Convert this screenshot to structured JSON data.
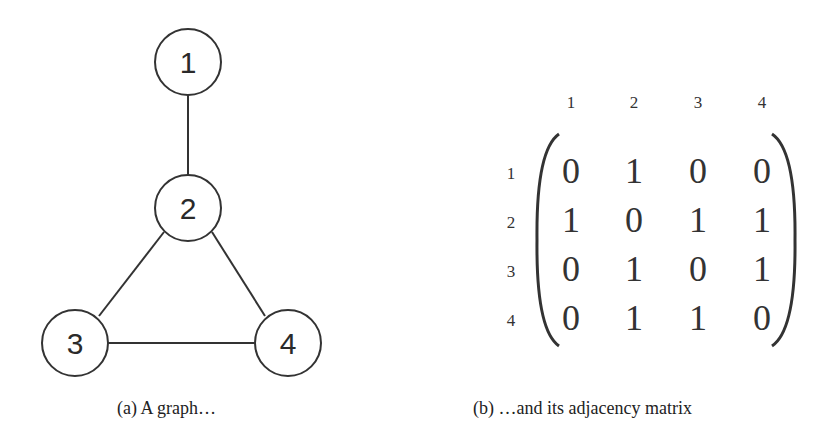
{
  "graph": {
    "nodes": [
      {
        "id": "1",
        "x": 188,
        "y": 62
      },
      {
        "id": "2",
        "x": 188,
        "y": 208
      },
      {
        "id": "3",
        "x": 75,
        "y": 343
      },
      {
        "id": "4",
        "x": 288,
        "y": 343
      }
    ],
    "edges": [
      [
        "1",
        "2"
      ],
      [
        "2",
        "3"
      ],
      [
        "2",
        "4"
      ],
      [
        "3",
        "4"
      ]
    ],
    "caption": "(a)  A graph…"
  },
  "matrix": {
    "col_labels": [
      "1",
      "2",
      "3",
      "4"
    ],
    "row_labels": [
      "1",
      "2",
      "3",
      "4"
    ],
    "rows": [
      [
        "0",
        "1",
        "0",
        "0"
      ],
      [
        "1",
        "0",
        "1",
        "1"
      ],
      [
        "0",
        "1",
        "0",
        "1"
      ],
      [
        "0",
        "1",
        "1",
        "0"
      ]
    ],
    "caption": "(b)  …and its adjacency matrix"
  }
}
